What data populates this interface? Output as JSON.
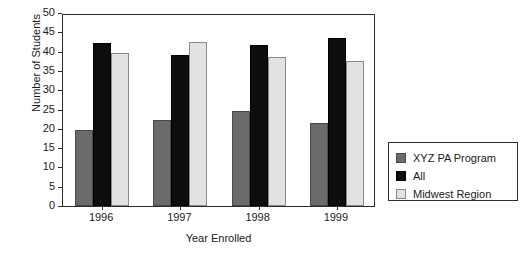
{
  "chart_data": {
    "type": "bar",
    "title": "",
    "xlabel": "Year Enrolled",
    "ylabel": "Number of Students",
    "categories": [
      "1996",
      "1997",
      "1998",
      "1999"
    ],
    "ylim": [
      0,
      50
    ],
    "yticks": [
      0,
      5,
      10,
      15,
      20,
      25,
      30,
      35,
      40,
      45,
      50
    ],
    "grid": false,
    "legend_position": "right",
    "series": [
      {
        "name": "XYZ PA Program",
        "color": "#6b6b6b",
        "values": [
          19.7,
          22.3,
          24.6,
          21.5
        ]
      },
      {
        "name": "All",
        "color": "#0d0d0d",
        "values": [
          42.3,
          39.2,
          41.8,
          43.5
        ]
      },
      {
        "name": "Midwest Region",
        "color": "#e2e2e2",
        "values": [
          39.7,
          42.6,
          38.5,
          37.5
        ]
      }
    ]
  },
  "axis": {
    "y_title": "Number of Students",
    "x_title": "Year Enrolled",
    "y_tick_labels": [
      "0",
      "5",
      "10",
      "15",
      "20",
      "25",
      "30",
      "35",
      "40",
      "45",
      "50"
    ],
    "x_tick_labels": [
      "1996",
      "1997",
      "1998",
      "1999"
    ]
  },
  "legend": {
    "items": [
      {
        "label": "XYZ PA Program"
      },
      {
        "label": "All"
      },
      {
        "label": "Midwest Region"
      }
    ]
  }
}
